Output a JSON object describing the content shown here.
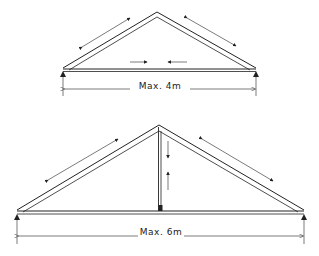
{
  "diagram": {
    "type": "roof truss span diagram",
    "trusses": [
      {
        "id": "small-truss",
        "label": "Max. 4m",
        "members": [
          "left rafter",
          "right rafter",
          "tie beam"
        ],
        "force_arrows": [
          "rafter axial (both rafters)",
          "tie beam compression toward center"
        ]
      },
      {
        "id": "large-truss",
        "label": "Max. 6m",
        "members": [
          "left rafter",
          "right rafter",
          "tie beam",
          "king post"
        ],
        "force_arrows": [
          "rafter axial (both rafters)",
          "king post vertical opposing arrows"
        ]
      }
    ],
    "line_color": "#222222",
    "background": "#ffffff"
  }
}
